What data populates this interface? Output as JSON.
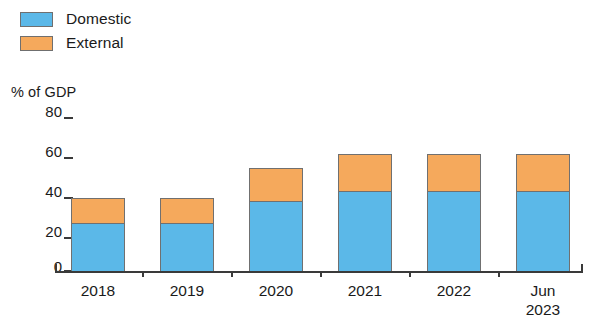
{
  "legend": {
    "items": [
      {
        "label": "Domestic",
        "color": "#5BB8E8",
        "icon": "legend-swatch-icon"
      },
      {
        "label": "External",
        "color": "#F5A95C",
        "icon": "legend-swatch-icon"
      }
    ]
  },
  "axis": {
    "unit_caption": "% of GDP",
    "yticks": [
      "80",
      "60",
      "40",
      "20",
      "0"
    ]
  },
  "chart_data": {
    "type": "bar",
    "title": "",
    "subtitle": "",
    "xlabel": "",
    "ylabel": "% of GDP",
    "ylim": [
      0,
      80
    ],
    "yticks": [
      0,
      20,
      40,
      60,
      80
    ],
    "grid": false,
    "stacked": true,
    "legend_position": "top-left",
    "categories": [
      "2018",
      "2019",
      "2020",
      "2021",
      "2022",
      "Jun 2023"
    ],
    "series": [
      {
        "name": "Domestic",
        "color": "#5BB8E8",
        "values": [
          25,
          25,
          36,
          41,
          41,
          41
        ]
      },
      {
        "name": "External",
        "color": "#F5A95C",
        "values": [
          13,
          13,
          17,
          19,
          19,
          19
        ]
      }
    ],
    "totals": [
      38,
      38,
      53,
      60,
      60,
      60
    ],
    "annotations": []
  },
  "xlabels": [
    {
      "line1": "2018",
      "line2": ""
    },
    {
      "line1": "2019",
      "line2": ""
    },
    {
      "line1": "2020",
      "line2": ""
    },
    {
      "line1": "2021",
      "line2": ""
    },
    {
      "line1": "2022",
      "line2": ""
    },
    {
      "line1": "Jun",
      "line2": "2023"
    }
  ]
}
